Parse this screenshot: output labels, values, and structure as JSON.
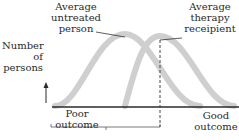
{
  "diagram": {
    "y_axis_label": [
      "Number",
      "of",
      "persons"
    ],
    "curves": [
      {
        "name": "Average untreated person",
        "label_lines": [
          "Average",
          "untreated",
          "person"
        ],
        "relative_peak_position": 0.39
      },
      {
        "name": "Average therapy receipient",
        "label_lines": [
          "Average",
          "therapy",
          "receipient"
        ],
        "relative_peak_position": 0.58
      }
    ],
    "x_axis_left_label": [
      "Poor",
      "outcome"
    ],
    "x_axis_right_label": [
      "Good",
      "outcome"
    ],
    "curve_color": "#cfcfcf",
    "line_color": "#2a2a2a"
  }
}
